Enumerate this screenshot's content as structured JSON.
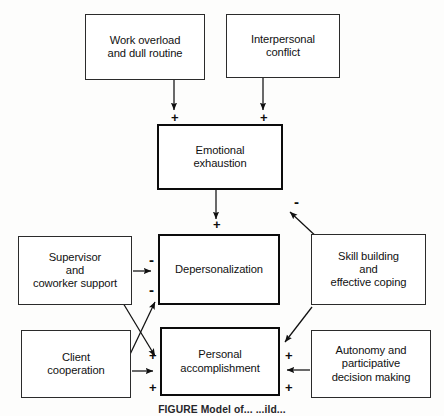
{
  "figure": {
    "caption": "FIGURE   Model of... ...ild...",
    "stroke_color": "#2b2b2b",
    "core_stroke_color": "#0c0c0c",
    "background": "#ffffff"
  },
  "nodes": {
    "work_overload": {
      "label": "Work overload\nand dull routine"
    },
    "interpersonal_conflict": {
      "label": "Interpersonal\nconflict"
    },
    "emotional_exhaustion": {
      "label": "Emotional\nexhaustion"
    },
    "supervisor_support": {
      "label": "Supervisor\nand\ncoworker support"
    },
    "depersonalization": {
      "label": "Depersonalization"
    },
    "skill_building": {
      "label": "Skill building\nand\neffective coping"
    },
    "client_cooperation": {
      "label": "Client\ncooperation"
    },
    "personal_accomplishment": {
      "label": "Personal\naccomplishment"
    },
    "autonomy": {
      "label": "Autonomy and\nparticipative\ndecision making"
    }
  },
  "signs": {
    "work_to_ee": "+",
    "conflict_to_ee": "+",
    "ee_to_skill": "-",
    "ee_to_dep": "+",
    "support_to_dep": "-",
    "cooperation_to_dep": "-",
    "cooperation_to_pa": "+",
    "support_to_pa": "+",
    "skill_to_pa": "+",
    "autonomy_to_pa": "+"
  }
}
